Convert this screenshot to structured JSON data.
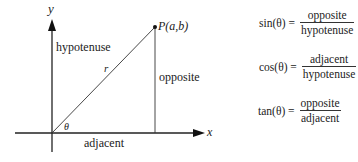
{
  "diagram": {
    "type": "right-triangle-unit-circle-style",
    "axes": {
      "x_label": "x",
      "y_label": "y"
    },
    "point": {
      "label": "P(a,b)",
      "letter": "P",
      "coords": "(a,b)"
    },
    "hypotenuse_symbol": "r",
    "angle_symbol": "θ",
    "side_labels": {
      "hypotenuse": "hypotenuse",
      "opposite": "opposite",
      "adjacent": "adjacent"
    },
    "colors": {
      "line": "#222222",
      "text": "#222222",
      "background": "#ffffff"
    }
  },
  "formulas": [
    {
      "name": "sin",
      "lhs": "sin(θ) =",
      "numerator": "opposite",
      "denominator": "hypotenuse"
    },
    {
      "name": "cos",
      "lhs": "cos(θ) =",
      "numerator": "adjacent",
      "denominator": "hypotenuse"
    },
    {
      "name": "tan",
      "lhs": "tan(θ) =",
      "numerator": "opposite",
      "denominator": "adjacent"
    }
  ]
}
